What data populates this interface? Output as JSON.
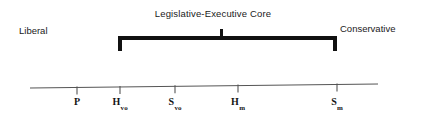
{
  "figure": {
    "title": "Legislative-Executive Core",
    "left_end_label": "Liberal",
    "right_end_label": "Conservative"
  },
  "bracket": {
    "span_start_x": 119,
    "span_end_x": 336,
    "center_tick_x": 221
  },
  "axis": {
    "line_color": "#555555",
    "start_x": 30,
    "end_x": 378,
    "start_y": 88,
    "end_y": 84
  },
  "chart_data": {
    "type": "scatter",
    "title": "Legislative-Executive Core",
    "xlabel": "",
    "ylabel": "",
    "orientation": "horizontal-number-line",
    "axis_left_annotation": "Liberal",
    "axis_right_annotation": "Conservative",
    "grid": false,
    "legend": "none",
    "xlim": [
      30,
      378
    ],
    "categories": [
      "P",
      "Hvo",
      "Svo",
      "Hm",
      "Sm"
    ],
    "points": [
      {
        "base": "P",
        "subscript": "",
        "x": 77
      },
      {
        "base": "H",
        "subscript": "vo",
        "x": 120
      },
      {
        "base": "S",
        "subscript": "vo",
        "x": 175
      },
      {
        "base": "H",
        "subscript": "m",
        "x": 238
      },
      {
        "base": "S",
        "subscript": "m",
        "x": 337
      }
    ],
    "annotations": [
      {
        "text": "Legislative-Executive Core",
        "type": "bracket",
        "from": "Hvo",
        "to": "Sm",
        "from_x": 119,
        "to_x": 336
      }
    ]
  }
}
